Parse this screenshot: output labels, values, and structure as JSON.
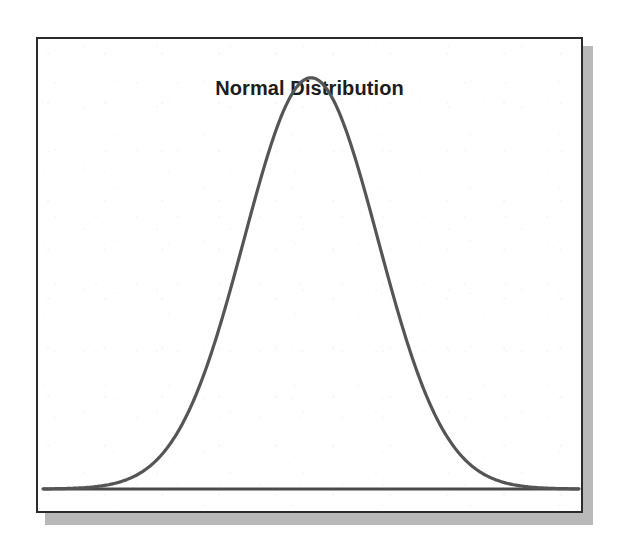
{
  "figure": {
    "title": "Normal Distribution",
    "frame_color": "#2b2b2b",
    "shadow_color": "#b9b9b9",
    "paper_color": "#ffffff",
    "curve_color": "#555555",
    "axis_color": "#4a4a4a",
    "title_color": "#1c1c1c"
  },
  "chart_data": {
    "type": "line",
    "title": "Normal Distribution",
    "xlabel": "",
    "ylabel": "",
    "grid": false,
    "legend": "none",
    "xlim": [
      -4,
      4
    ],
    "ylim": [
      0,
      0.42
    ],
    "series": [
      {
        "name": "Normal density (mean 0, sd 1)",
        "x": [
          -4.0,
          -3.75,
          -3.5,
          -3.25,
          -3.0,
          -2.75,
          -2.5,
          -2.25,
          -2.0,
          -1.75,
          -1.5,
          -1.25,
          -1.0,
          -0.75,
          -0.5,
          -0.25,
          0.0,
          0.25,
          0.5,
          0.75,
          1.0,
          1.25,
          1.5,
          1.75,
          2.0,
          2.25,
          2.5,
          2.75,
          3.0,
          3.25,
          3.5,
          3.75,
          4.0
        ],
        "y": [
          0.0001,
          0.0004,
          0.0009,
          0.002,
          0.0044,
          0.0091,
          0.0175,
          0.0317,
          0.054,
          0.0863,
          0.1295,
          0.1826,
          0.242,
          0.3011,
          0.3521,
          0.3867,
          0.3989,
          0.3867,
          0.3521,
          0.3011,
          0.242,
          0.1826,
          0.1295,
          0.0863,
          0.054,
          0.0317,
          0.0175,
          0.0091,
          0.0044,
          0.002,
          0.0009,
          0.0004,
          0.0001
        ]
      }
    ],
    "peak": {
      "x": 0.0,
      "y": 0.3989
    },
    "axis_line": {
      "y": 0.0,
      "from_x": -4.0,
      "to_x": 4.0
    }
  }
}
